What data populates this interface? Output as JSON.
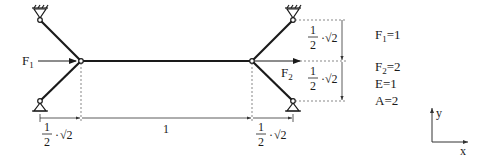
{
  "diagram": {
    "type": "truss-structure",
    "colors": {
      "member": "#1a1a1a",
      "dim": "#333333",
      "dashed": "#555555",
      "background": "#ffffff"
    },
    "loads": {
      "F1": {
        "label": "F",
        "sub": "1",
        "direction": "right",
        "at": "left-joint"
      },
      "F2": {
        "label": "F",
        "sub": "2",
        "direction": "right",
        "at": "right-joint"
      }
    },
    "dimensions": {
      "left_horizontal": {
        "num": "1",
        "den": "2",
        "root": "√2"
      },
      "middle_horizontal": {
        "value": "1"
      },
      "right_horizontal": {
        "num": "1",
        "den": "2",
        "root": "√2"
      },
      "upper_vertical": {
        "num": "1",
        "den": "2",
        "root": "√2"
      },
      "lower_vertical": {
        "num": "1",
        "den": "2",
        "root": "√2"
      }
    },
    "parameters": [
      {
        "sym": "F",
        "sub": "1",
        "value": "=1"
      },
      {
        "sym": "F",
        "sub": "2",
        "value": "=2"
      },
      {
        "sym": "E",
        "sub": "",
        "value": "=1"
      },
      {
        "sym": "A",
        "sub": "",
        "value": "=2"
      }
    ],
    "axes": {
      "x_label": "x",
      "y_label": "y"
    },
    "supports": [
      "top-left",
      "bottom-left",
      "top-right",
      "bottom-right"
    ],
    "joints": [
      "left-joint",
      "right-joint"
    ]
  }
}
